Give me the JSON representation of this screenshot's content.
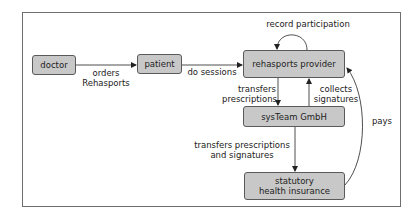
{
  "diagram": {
    "nodes": [
      {
        "id": "doctor",
        "label": "doctor"
      },
      {
        "id": "patient",
        "label": "patient"
      },
      {
        "id": "rehasports-provider",
        "label": "rehasports provider"
      },
      {
        "id": "systeam-gmbh",
        "label": "sysTeam GmbH"
      },
      {
        "id": "statutory-health-insurance",
        "label": "statutory\nhealth insurance"
      }
    ],
    "edges": [
      {
        "from": "doctor",
        "to": "patient",
        "label": "orders\nRehasports"
      },
      {
        "from": "patient",
        "to": "rehasports-provider",
        "label": "do sessions"
      },
      {
        "from": "rehasports-provider",
        "to": "rehasports-provider",
        "label": "record participation"
      },
      {
        "from": "rehasports-provider",
        "to": "systeam-gmbh",
        "label": "transfers\nprescriptions"
      },
      {
        "from": "systeam-gmbh",
        "to": "rehasports-provider",
        "label": "collects\nsignatures"
      },
      {
        "from": "systeam-gmbh",
        "to": "statutory-health-insurance",
        "label": "transfers prescriptions\nand signatures"
      },
      {
        "from": "statutory-health-insurance",
        "to": "rehasports-provider",
        "label": "pays"
      }
    ],
    "colors": {
      "node_fill": "#c8c8c8",
      "node_border": "#5a5a5a",
      "edge": "#222222"
    }
  }
}
